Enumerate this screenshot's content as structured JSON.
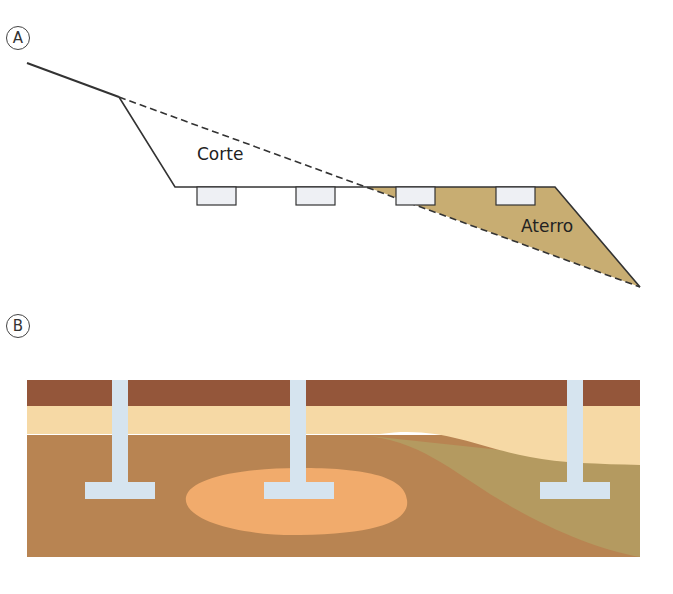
{
  "figure": {
    "panels": [
      {
        "id": "A",
        "label": "A",
        "annotations": {
          "cut": "Corte",
          "fill": "Aterro"
        },
        "elements": [
          "original-ground-line",
          "cut-slope",
          "platform",
          "fill-slope",
          "foundation-blocks"
        ],
        "foundation_count": 4
      },
      {
        "id": "B",
        "label": "B",
        "layers": [
          "topsoil",
          "light-sand-layer",
          "brown-soil",
          "olive-soil-wedge",
          "orange-soft-lens"
        ],
        "footing_count": 3
      }
    ]
  },
  "colors": {
    "fill_khaki": "#c8ad72",
    "line": "#333333",
    "block_fill": "#eef0f4",
    "topsoil": "#94563a",
    "sand": "#f6d9a5",
    "brown_soil": "#b88452",
    "olive_soil": "#b49a60",
    "orange_lens": "#f1ab6c",
    "footing": "#d6e4ef"
  }
}
